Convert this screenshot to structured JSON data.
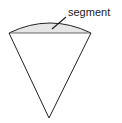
{
  "diagram": {
    "labels": {
      "segment": "segment"
    },
    "colors": {
      "stroke": "#222222",
      "segment_fill": "#e6e6e6",
      "chord": "#666666",
      "background": "#ffffff"
    },
    "shapes": {
      "sector_apex": [
        49,
        118
      ],
      "chord_left": [
        9,
        33
      ],
      "chord_right": [
        91,
        33
      ],
      "arc_peak": [
        50,
        23
      ],
      "leader_line": [
        [
          52,
          29
        ],
        [
          66,
          17
        ]
      ]
    }
  }
}
